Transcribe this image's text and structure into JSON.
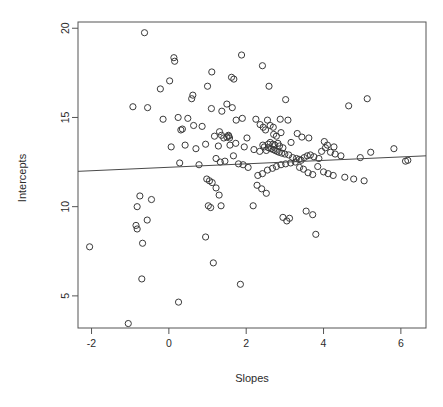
{
  "chart_data": {
    "type": "scatter",
    "title": "",
    "xlabel": "Slopes",
    "ylabel": "Intercepts",
    "xlim": [
      -2.35,
      6.65
    ],
    "ylim": [
      3.2,
      20.35
    ],
    "grid": false,
    "legend": null,
    "xticks": [
      -2,
      0,
      2,
      4,
      6
    ],
    "xtick_labels": [
      "-2",
      "0",
      "2",
      "4",
      "6"
    ],
    "yticks": [
      5,
      10,
      15,
      20
    ],
    "ytick_labels": [
      "5",
      "10",
      "15",
      "20"
    ],
    "marker": "open-circle",
    "marker_color": "#3a3a3a",
    "n_points": 163,
    "series": [
      {
        "name": "observations",
        "x": [
          -0.63,
          0.13,
          0.15,
          1.88,
          2.42,
          0.02,
          0.62,
          0.59,
          1.0,
          1.11,
          1.62,
          1.68,
          2.59,
          -0.22,
          0.24,
          1.1,
          3.02,
          -0.55,
          0.49,
          1.37,
          1.5,
          1.64,
          1.74,
          1.9,
          2.25,
          2.55,
          2.62,
          2.7,
          2.88,
          -0.93,
          0.35,
          0.86,
          1.31,
          1.54,
          2.02,
          2.36,
          2.44,
          2.5,
          2.71,
          2.78,
          2.9,
          3.08,
          -0.15,
          0.31,
          0.64,
          1.18,
          1.36,
          1.5,
          1.55,
          1.57,
          1.73,
          2.43,
          2.47,
          2.57,
          2.62,
          2.69,
          2.74,
          2.82,
          2.86,
          2.95,
          3.16,
          3.32,
          3.44,
          3.62,
          4.02,
          4.1,
          4.27,
          4.65,
          5.13,
          0.06,
          0.42,
          0.7,
          0.95,
          1.28,
          1.42,
          1.58,
          1.95,
          2.2,
          2.35,
          2.52,
          2.58,
          2.64,
          2.7,
          2.75,
          2.8,
          2.85,
          2.92,
          3.0,
          3.1,
          3.2,
          3.3,
          3.37,
          3.42,
          3.5,
          3.58,
          3.66,
          3.75,
          3.88,
          3.95,
          4.05,
          4.18,
          4.3,
          4.45,
          4.95,
          5.22,
          5.82,
          6.18,
          0.28,
          0.78,
          1.22,
          1.33,
          1.45,
          1.67,
          1.8,
          1.92,
          2.05,
          2.3,
          2.42,
          2.55,
          2.68,
          2.78,
          2.9,
          3.02,
          3.15,
          3.27,
          3.38,
          3.48,
          3.6,
          3.72,
          3.85,
          4.0,
          4.12,
          4.25,
          4.55,
          4.78,
          5.05,
          6.12,
          -0.75,
          -0.45,
          -0.82,
          -0.56,
          -0.85,
          -0.82,
          -0.68,
          0.98,
          1.05,
          1.12,
          1.22,
          1.3,
          1.02,
          1.08,
          1.35,
          2.18,
          2.28,
          2.4,
          2.52,
          2.95,
          3.05,
          3.12,
          3.55,
          3.72,
          3.8,
          -2.05,
          -0.7,
          0.95,
          1.15,
          1.85,
          0.25,
          -1.05
        ],
        "y": [
          19.75,
          18.35,
          18.15,
          18.5,
          17.9,
          17.05,
          16.25,
          16.05,
          16.75,
          17.55,
          17.25,
          17.15,
          16.75,
          16.6,
          15.0,
          15.5,
          16.0,
          15.55,
          14.95,
          15.35,
          15.75,
          15.55,
          14.85,
          14.95,
          14.9,
          14.85,
          14.55,
          14.45,
          14.9,
          15.6,
          14.35,
          14.5,
          14.2,
          14.0,
          13.85,
          14.6,
          14.45,
          14.3,
          14.05,
          13.95,
          14.15,
          14.85,
          14.9,
          14.3,
          14.55,
          13.95,
          14.0,
          13.9,
          13.95,
          13.85,
          13.55,
          13.45,
          13.35,
          13.5,
          13.6,
          13.5,
          13.45,
          13.55,
          13.4,
          13.3,
          13.6,
          14.1,
          13.9,
          13.85,
          13.65,
          13.45,
          13.35,
          15.65,
          16.05,
          13.35,
          13.45,
          13.25,
          13.5,
          13.4,
          13.85,
          13.45,
          13.35,
          13.2,
          13.1,
          13.15,
          13.3,
          13.25,
          13.2,
          13.15,
          13.1,
          13.05,
          13.0,
          12.95,
          12.9,
          12.75,
          12.7,
          12.65,
          12.6,
          12.75,
          12.85,
          12.9,
          12.8,
          12.7,
          13.1,
          13.3,
          13.05,
          12.95,
          12.85,
          12.75,
          13.05,
          13.25,
          12.6,
          12.45,
          12.35,
          12.7,
          12.5,
          12.55,
          12.85,
          12.4,
          12.35,
          12.2,
          11.75,
          11.85,
          12.05,
          12.15,
          12.25,
          12.35,
          12.4,
          12.45,
          12.5,
          12.2,
          12.1,
          11.9,
          11.8,
          12.25,
          11.95,
          11.85,
          11.75,
          11.65,
          11.55,
          11.45,
          12.55,
          10.6,
          10.4,
          10.0,
          9.25,
          8.95,
          8.75,
          7.95,
          11.55,
          11.45,
          11.35,
          11.05,
          10.65,
          10.05,
          9.95,
          10.05,
          10.05,
          11.2,
          11.0,
          10.75,
          9.4,
          9.2,
          9.35,
          9.75,
          9.55,
          8.45,
          7.75,
          5.95,
          8.3,
          6.85,
          5.65,
          4.65,
          3.45
        ]
      }
    ],
    "trendline": {
      "name": "least-squares-fit",
      "x_start": -2.35,
      "y_start": 11.98,
      "x_end": 6.65,
      "y_end": 12.85,
      "slope": 0.097,
      "intercept": 12.21
    }
  },
  "axes": {
    "x_title": "Slopes",
    "y_title": "Intercepts"
  }
}
